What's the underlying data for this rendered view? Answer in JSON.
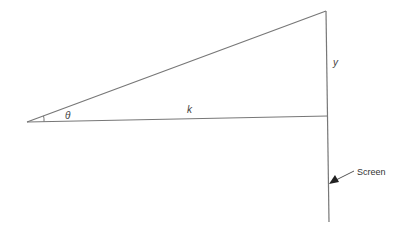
{
  "diagram": {
    "type": "geometry-triangle",
    "labels": {
      "angle": "θ",
      "base": "k",
      "height": "y",
      "screen": "Screen"
    },
    "colors": {
      "line": "#777777",
      "text": "#444444",
      "background": "#ffffff"
    },
    "points": {
      "apex_left": [
        27,
        122
      ],
      "base_right": [
        328,
        116
      ],
      "top_right": [
        326,
        11
      ],
      "screen_bottom": [
        329,
        222
      ]
    }
  }
}
